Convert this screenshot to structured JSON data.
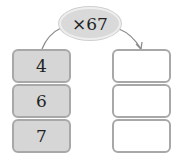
{
  "operation": {
    "label": "×67",
    "fill_color": "#d9d9d9"
  },
  "inputs": [
    {
      "value": "4"
    },
    {
      "value": "6"
    },
    {
      "value": "7"
    }
  ],
  "outputs": [
    {
      "value": ""
    },
    {
      "value": ""
    },
    {
      "value": ""
    }
  ],
  "colors": {
    "input_fill": "#d6d6d6",
    "box_border": "#a8a8a8",
    "arrow": "#888888"
  }
}
